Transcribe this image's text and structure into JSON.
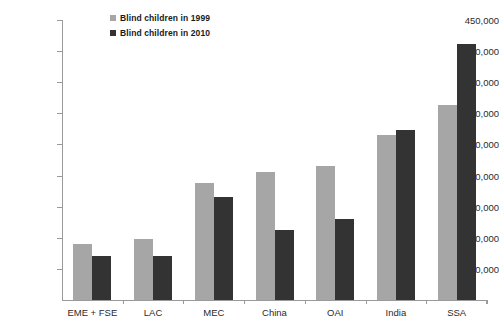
{
  "chart_data": {
    "type": "bar",
    "title": "",
    "xlabel": "",
    "ylabel": "",
    "grid": false,
    "legend_position": "top-center-left",
    "ylim": [
      0,
      450000
    ],
    "ytick_step": 50000,
    "categories": [
      "EME + FSE",
      "LAC",
      "MEC",
      "China",
      "OAI",
      "India",
      "SSA"
    ],
    "ytick_labels": [
      "50,000",
      "100,000",
      "150,000",
      "200,000",
      "250,000",
      "300,000",
      "350,000",
      "400,000",
      "450,000"
    ],
    "ytick_values": [
      50000,
      100000,
      150000,
      200000,
      250000,
      300000,
      350000,
      400000,
      450000
    ],
    "series": [
      {
        "name": "Blind children in 1999",
        "color": "#a6a6a6",
        "values": [
          90000,
          98000,
          188000,
          206000,
          216000,
          265000,
          313000
        ]
      },
      {
        "name": "Blind children in 2010",
        "color": "#333333",
        "values": [
          70000,
          70000,
          165000,
          112000,
          131000,
          274000,
          411000
        ]
      }
    ]
  },
  "legend": {
    "items": [
      {
        "label": "Blind children in 1999",
        "color": "#a6a6a6"
      },
      {
        "label": "Blind children in 2010",
        "color": "#333333"
      }
    ]
  },
  "axes": {
    "axis_color": "#9a9a9a"
  }
}
